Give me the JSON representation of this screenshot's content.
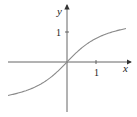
{
  "chart_data": {
    "type": "line",
    "title": "",
    "function": "y = arctan(x)",
    "xlabel": "x",
    "ylabel": "y",
    "x_ticks": [
      {
        "value": 1,
        "label": "1"
      }
    ],
    "y_ticks": [
      {
        "value": 1,
        "label": "1"
      }
    ],
    "xlim": [
      -2.03,
      2.1
    ],
    "ylim": [
      -1.7,
      1.8
    ],
    "grid": false,
    "legend": null,
    "series": [
      {
        "name": "curve",
        "x": [
          -2.0,
          -1.5,
          -1.0,
          -0.5,
          0,
          0.5,
          1.0,
          1.5,
          2.0
        ],
        "values": [
          -1.107,
          -0.983,
          -0.785,
          -0.464,
          0,
          0.464,
          0.785,
          0.983,
          1.107
        ]
      }
    ],
    "colors": {
      "curve": "#8a8a8a",
      "axes": "#333333"
    }
  },
  "labels": {
    "x": "x",
    "y": "y",
    "xtick": "1",
    "ytick": "1"
  }
}
